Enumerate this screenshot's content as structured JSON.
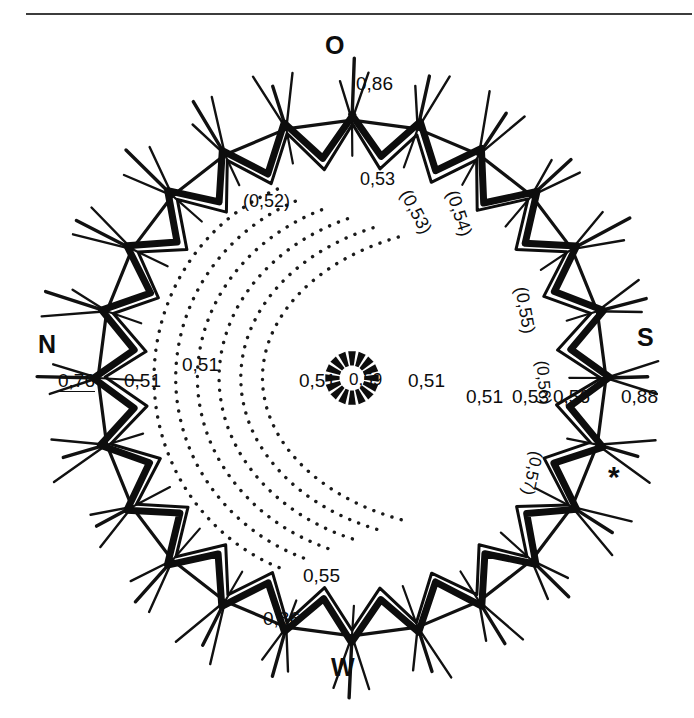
{
  "figure": {
    "title_rule": "",
    "compass": {
      "top": "O",
      "bottom": "W",
      "left": "N",
      "right": "S",
      "marker": "*"
    },
    "outer_labels": [
      {
        "id": "top-0-86",
        "text": "0,86"
      },
      {
        "id": "bottom-0-86",
        "text": "0,86"
      },
      {
        "id": "right-0-88",
        "text": "0,88"
      },
      {
        "id": "left-0-76",
        "text": "0,76"
      }
    ],
    "inner_labels": [
      {
        "id": "left-inner-0-51",
        "text": "0,51"
      },
      {
        "id": "left-mid-0-51",
        "text": "0,51"
      },
      {
        "id": "centre-left-0-51",
        "text": "0,51"
      },
      {
        "id": "centre-0-59",
        "text": "0,59"
      },
      {
        "id": "centre-right-0-51",
        "text": "0,51"
      },
      {
        "id": "right-inner-0-51",
        "text": "0,51"
      }
    ],
    "contour_labels": [
      {
        "id": "c-0-52",
        "text": "(0,52)",
        "rotation": 0
      },
      {
        "id": "c-0-53",
        "text": "0,53",
        "rotation": 0
      },
      {
        "id": "c-0-53p",
        "text": "(0,53)",
        "rotation": 62
      },
      {
        "id": "c-0-54",
        "text": "(0,54)",
        "rotation": 72
      },
      {
        "id": "c-0-55p",
        "text": "(0,55)",
        "rotation": 80
      },
      {
        "id": "c-0-56p",
        "text": "(0,56)",
        "rotation": 86
      },
      {
        "id": "c-0-53b",
        "text": "0,53",
        "rotation": 0
      },
      {
        "id": "c-0-56b",
        "text": "0,56",
        "rotation": 0
      },
      {
        "id": "c-0-57p",
        "text": "(0,57)",
        "rotation": 102
      },
      {
        "id": "c-0-55b",
        "text": "0,55",
        "rotation": 0
      }
    ],
    "colors": {
      "ink": "#0d0d0d",
      "rule": "#3c3c3c",
      "paper": "#ffffff"
    }
  },
  "chart_data": {
    "type": "diagram",
    "title": "",
    "compass_points": [
      "O",
      "W",
      "N",
      "S"
    ],
    "centre_value": "0,59",
    "plateau_value": "0,51",
    "peak_values": [
      "0,86",
      "0,88",
      "0,76",
      "0,86"
    ],
    "contour_values": [
      "(0,52)",
      "0,53",
      "(0,53)",
      "(0,54)",
      "(0,55)",
      "(0,56)",
      "0,53",
      "0,56",
      "(0,57)",
      "0,55"
    ],
    "value_range": [
      0.51,
      0.88
    ],
    "ring_teeth": 24,
    "contour_arc_count": 6
  }
}
